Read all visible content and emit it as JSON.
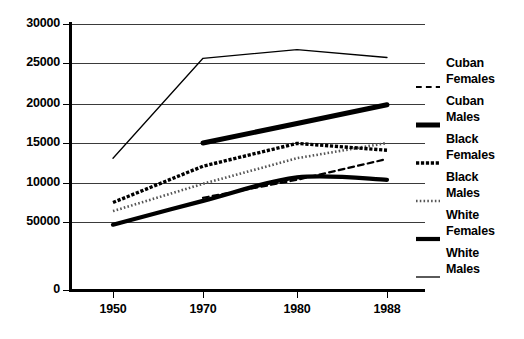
{
  "chart_data": {
    "type": "line",
    "title": "",
    "subtitle": "",
    "xlabel": "",
    "ylabel": "",
    "x": [
      "1950",
      "1970",
      "1980",
      "1988"
    ],
    "xtick_labels": [
      "1950",
      "1970",
      "1980",
      "1988"
    ],
    "ytick_labels": [
      "0",
      "50000",
      "10000",
      "15000",
      "20000",
      "25000",
      "30000"
    ],
    "ytick_values": [
      0,
      5000,
      10000,
      15000,
      20000,
      25000,
      30000
    ],
    "ylim": [
      0,
      30000
    ],
    "grid": true,
    "grid_axis": "y",
    "legend_position": "right",
    "note": "Bottom y tick is printed as 50000 in the source image; it denotes 5000.",
    "series": [
      {
        "name": "Cuban Females",
        "style": "dashed",
        "width": 2.2,
        "color": "#000000",
        "x": [
          "1970",
          "1980",
          "1988"
        ],
        "values": [
          8100,
          10400,
          13000
        ]
      },
      {
        "name": "Cuban Males",
        "style": "thick-solid",
        "width": 5.0,
        "color": "#000000",
        "x": [
          "1970",
          "1980",
          "1988"
        ],
        "values": [
          15000,
          17500,
          19900
        ]
      },
      {
        "name": "Black Females",
        "style": "heavy-dotted",
        "width": 3.4,
        "color": "#000000",
        "x": [
          "1950",
          "1970",
          "1980",
          "1988"
        ],
        "values": [
          7500,
          12100,
          14950,
          14100
        ]
      },
      {
        "name": "Black Males",
        "style": "fine-dotted",
        "width": 2.6,
        "color": "#555555",
        "x": [
          "1950",
          "1970",
          "1980",
          "1988"
        ],
        "values": [
          6400,
          9900,
          13100,
          15000
        ]
      },
      {
        "name": "White Females",
        "style": "thick-solid-curve",
        "width": 4.2,
        "color": "#000000",
        "x": [
          "1950",
          "1970",
          "1980",
          "1988"
        ],
        "values": [
          4800,
          7700,
          10700,
          10400
        ]
      },
      {
        "name": "White Males",
        "style": "thin-solid",
        "width": 1.3,
        "color": "#000000",
        "x": [
          "1950",
          "1970",
          "1980",
          "1988"
        ],
        "values": [
          13100,
          25600,
          26700,
          25700
        ]
      }
    ]
  },
  "legend": {
    "entries": [
      {
        "line1": "Cuban",
        "line2": "Females",
        "swatch": "dashed"
      },
      {
        "line1": "Cuban",
        "line2": "Males",
        "swatch": "thick-solid"
      },
      {
        "line1": "Black",
        "line2": "Females",
        "swatch": "heavy-dotted"
      },
      {
        "line1": "Black",
        "line2": "Males",
        "swatch": "fine-dotted"
      },
      {
        "line1": "White",
        "line2": "Females",
        "swatch": "thick-solid-curve"
      },
      {
        "line1": "White",
        "line2": "Males",
        "swatch": "thin-solid"
      }
    ]
  },
  "axes": {
    "y_labels": [
      "30000",
      "25000",
      "20000",
      "15000",
      "10000",
      "50000",
      "0"
    ],
    "y_label_positions": [
      24,
      63,
      104,
      143,
      183,
      222,
      290
    ],
    "x_labels": [
      "1950",
      "1970",
      "1980",
      "1988"
    ],
    "x_label_positions": [
      113,
      203,
      297,
      387
    ]
  }
}
